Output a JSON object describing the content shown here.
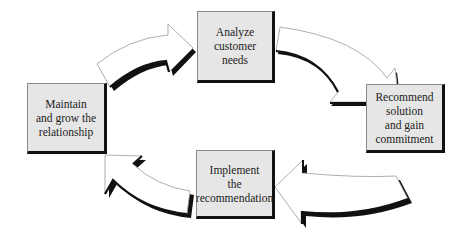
{
  "diagram": {
    "type": "cycle",
    "colors": {
      "box_fill": "#e6e6e6",
      "box_shadow": "#111111",
      "arrow_fill": "#ffffff",
      "arrow_outline": "#9a9a9a",
      "arrow_shadow": "#111111",
      "text": "#222222"
    },
    "nodes": [
      {
        "id": "analyze",
        "label": "Analyze\ncustomer\nneeds"
      },
      {
        "id": "recommend",
        "label": "Recommend\nsolution\nand gain\ncommitment"
      },
      {
        "id": "implement",
        "label": "Implement\nthe\nrecommendation"
      },
      {
        "id": "maintain",
        "label": "Maintain\nand grow the\nrelationship"
      }
    ],
    "edges": [
      {
        "from": "maintain",
        "to": "analyze"
      },
      {
        "from": "analyze",
        "to": "recommend"
      },
      {
        "from": "recommend",
        "to": "implement"
      },
      {
        "from": "implement",
        "to": "maintain"
      }
    ]
  }
}
